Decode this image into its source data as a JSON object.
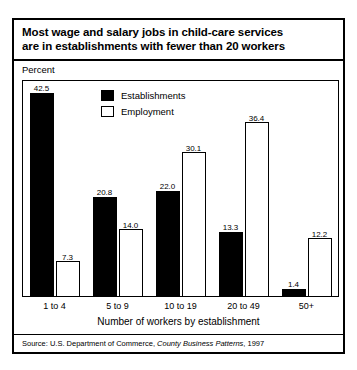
{
  "figure": {
    "title_lines": [
      "Most wage and salary jobs in child-care services",
      "are in establishments with fewer than 20 workers"
    ],
    "percent_caption": "Percent",
    "source_prefix": "Source: U.S. Department of Commerce, ",
    "source_italic": "County Business Patterns",
    "source_suffix": ", 1997"
  },
  "chart_data": {
    "type": "bar",
    "title": "Most wage and salary jobs in child-care services are in establishments with fewer than 20 workers",
    "xlabel": "Number of workers by establishment",
    "ylabel": "Percent",
    "ylim": [
      0,
      45
    ],
    "grid": false,
    "legend_position": "top-left-inside",
    "categories": [
      "1 to 4",
      "5 to 9",
      "10 to 19",
      "20 to 49",
      "50+"
    ],
    "series": [
      {
        "name": "Establishments",
        "color": "#000000",
        "style": "filled",
        "values": [
          42.5,
          20.8,
          22.0,
          13.3,
          1.4
        ],
        "labels": [
          "42.5",
          "20.8",
          "22.0",
          "13.3",
          "1.4"
        ]
      },
      {
        "name": "Employment",
        "color": "#ffffff",
        "style": "hollow",
        "values": [
          7.3,
          14.0,
          30.1,
          36.4,
          12.2
        ],
        "labels": [
          "7.3",
          "14.0",
          "30.1",
          "36.4",
          "12.2"
        ]
      }
    ]
  }
}
